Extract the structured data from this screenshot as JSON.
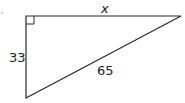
{
  "diagram": {
    "type": "right-triangle",
    "stroke_color": "#2a2a2a",
    "vertices": {
      "right_angle": [
        26,
        16
      ],
      "top_right": [
        181,
        16
      ],
      "bottom": [
        26,
        98
      ]
    },
    "labels": {
      "top_side": "x",
      "left_side": "33",
      "hypotenuse": "65"
    },
    "right_angle_marker": true,
    "stray_mark": "."
  }
}
